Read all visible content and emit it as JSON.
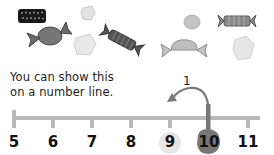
{
  "caption": {
    "line1": "You can show this",
    "line2": "on a number line."
  },
  "number_line": {
    "labels": [
      "5",
      "6",
      "7",
      "8",
      "9",
      "10",
      "11"
    ],
    "start_value": "10",
    "end_value": "9",
    "jump_label": "1",
    "jump_direction": "left",
    "colors": {
      "line": "#b9b9b9",
      "start_highlight": "#777777",
      "end_highlight": "#e6e6e6",
      "arrow": "#7a7a7a"
    }
  },
  "illustration": {
    "items": [
      "candy-bar",
      "wrapped-candy",
      "sugar-cube",
      "sugar-cube",
      "striped-candy",
      "round-candy",
      "wrapped-candy",
      "striped-candy",
      "sugar-cube"
    ]
  }
}
